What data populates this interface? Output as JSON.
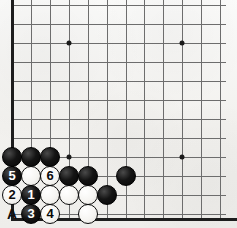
{
  "diagram": {
    "type": "go-board-diagram",
    "board": {
      "background_color": "#f4f3f0",
      "line_color": "#6d6d6d",
      "edge_color": "#1d1d1d",
      "grid_spacing": 18.9,
      "origin_x": 12,
      "origin_y": 5,
      "columns": 12,
      "rows": 12,
      "vertical_line_x": [
        12,
        31,
        50,
        69,
        88,
        107,
        126,
        144,
        163,
        182,
        201,
        220
      ],
      "horizontal_line_y": [
        5,
        24,
        43,
        62,
        81,
        100,
        119,
        138,
        157,
        176,
        195,
        214
      ],
      "left_edge_x": 12,
      "bottom_edge_y": 219
    },
    "star_points": [
      {
        "x": 69,
        "y": 43
      },
      {
        "x": 182,
        "y": 43
      },
      {
        "x": 69,
        "y": 157
      },
      {
        "x": 182,
        "y": 157
      }
    ],
    "stones": [
      {
        "color": "black",
        "x": 12,
        "y": 157,
        "label": ""
      },
      {
        "color": "black",
        "x": 31,
        "y": 157,
        "label": ""
      },
      {
        "color": "black",
        "x": 50,
        "y": 157,
        "label": ""
      },
      {
        "color": "black",
        "x": 12,
        "y": 176,
        "label": "5"
      },
      {
        "color": "white",
        "x": 31,
        "y": 176,
        "label": ""
      },
      {
        "color": "white",
        "x": 50,
        "y": 176,
        "label": "6"
      },
      {
        "color": "black",
        "x": 69,
        "y": 176,
        "label": ""
      },
      {
        "color": "black",
        "x": 88,
        "y": 176,
        "label": ""
      },
      {
        "color": "black",
        "x": 126,
        "y": 176,
        "label": ""
      },
      {
        "color": "white",
        "x": 12,
        "y": 195,
        "label": "2"
      },
      {
        "color": "black",
        "x": 31,
        "y": 195,
        "label": "1"
      },
      {
        "color": "white",
        "x": 50,
        "y": 195,
        "label": ""
      },
      {
        "color": "white",
        "x": 69,
        "y": 195,
        "label": ""
      },
      {
        "color": "white",
        "x": 88,
        "y": 195,
        "label": ""
      },
      {
        "color": "black",
        "x": 107,
        "y": 195,
        "label": ""
      },
      {
        "color": "black",
        "x": 31,
        "y": 214,
        "label": "3"
      },
      {
        "color": "white",
        "x": 50,
        "y": 214,
        "label": "4"
      },
      {
        "color": "white",
        "x": 88,
        "y": 214,
        "label": ""
      }
    ],
    "coordinate_labels": [
      {
        "text": "A",
        "x": 12,
        "y": 214
      }
    ],
    "move_sequence": [
      "1",
      "2",
      "3",
      "4",
      "5",
      "6"
    ],
    "point_marker": "A"
  }
}
